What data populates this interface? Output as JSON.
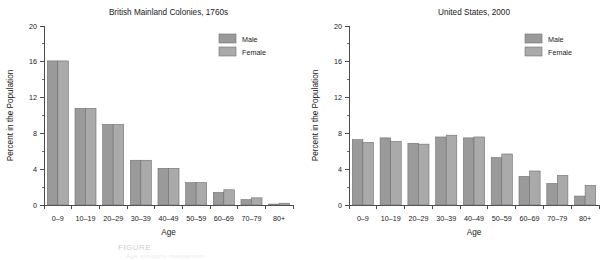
{
  "figure": {
    "caption_partial": "FIGURE",
    "caption_partial_2": "Age structure comparison",
    "colors": {
      "male": "#9a9a9a",
      "female": "#aaaaaa",
      "bar_edge": "#6f6f6f",
      "axis": "#4a4a4a",
      "text": "#1a1a1a",
      "background": "#ffffff"
    }
  },
  "chart_data": [
    {
      "type": "bar",
      "title": "British Mainland Colonies, 1760s",
      "xlabel": "Age",
      "ylabel": "Percent in the Population",
      "ylim": [
        0,
        20
      ],
      "yticks": [
        0,
        4,
        8,
        12,
        16,
        20
      ],
      "ytick_labels": [
        "0",
        "4",
        "8",
        "12",
        "16",
        "20"
      ],
      "minor_ticks_per_interval": 1,
      "grid": false,
      "legend_position": "top-right",
      "categories": [
        "0–9",
        "10–19",
        "20–29",
        "30–39",
        "40–49",
        "50–59",
        "60–69",
        "70–79",
        "80+"
      ],
      "series": [
        {
          "name": "Male",
          "color": "#9a9a9a",
          "values": [
            16.1,
            10.8,
            9.0,
            5.0,
            4.1,
            2.5,
            1.4,
            0.6,
            0.1
          ]
        },
        {
          "name": "Female",
          "color": "#aaaaaa",
          "values": [
            16.1,
            10.8,
            9.0,
            5.0,
            4.1,
            2.5,
            1.7,
            0.8,
            0.2
          ]
        }
      ]
    },
    {
      "type": "bar",
      "title": "United States, 2000",
      "xlabel": "Age",
      "ylabel": "Percent in the Population",
      "ylim": [
        0,
        20
      ],
      "yticks": [
        0,
        4,
        8,
        12,
        16,
        20
      ],
      "ytick_labels": [
        "0",
        "4",
        "8",
        "12",
        "16",
        "20"
      ],
      "minor_ticks_per_interval": 1,
      "grid": false,
      "legend_position": "top-right",
      "categories": [
        "0–9",
        "10–19",
        "20–29",
        "30–39",
        "40–49",
        "50–59",
        "60–69",
        "70–79",
        "80+"
      ],
      "series": [
        {
          "name": "Male",
          "color": "#9a9a9a",
          "values": [
            7.3,
            7.5,
            6.9,
            7.6,
            7.5,
            5.3,
            3.2,
            2.4,
            1.0
          ]
        },
        {
          "name": "Female",
          "color": "#aaaaaa",
          "values": [
            7.0,
            7.1,
            6.8,
            7.8,
            7.6,
            5.7,
            3.8,
            3.3,
            2.2
          ]
        }
      ]
    }
  ]
}
